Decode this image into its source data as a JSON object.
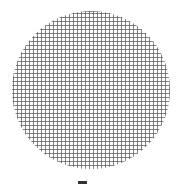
{
  "figure": {
    "shape": "circle",
    "pattern": "square grid",
    "grid_spacing_px": 4,
    "line_color": "#5a5a5a",
    "background_color": "#ffffff"
  },
  "caption": {
    "text": "",
    "mark_color": "#333333"
  }
}
